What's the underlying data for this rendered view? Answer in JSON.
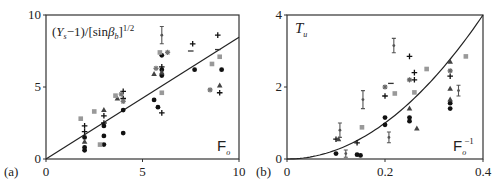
{
  "chart_data": [
    {
      "type": "scatter",
      "panel_label": "(a)",
      "title": "",
      "ylabel": "(Ys−1)/[sinβb]^1/2",
      "ylabel_parts": {
        "open": "(",
        "var": "Y",
        "sub": "s",
        "mid": "−1)/[sin",
        "greek": "β",
        "greek_sub": "b",
        "close": "]",
        "sup": "1/2"
      },
      "xlabel": "Fo",
      "xlabel_parts": {
        "main": "F",
        "sub": "o",
        "sup": ""
      },
      "xlim": [
        0,
        10
      ],
      "ylim": [
        0,
        10
      ],
      "xticks": [
        "0",
        "5",
        "10"
      ],
      "yticks": [
        "0",
        "5",
        "10"
      ],
      "fit_line": {
        "type": "linear",
        "x": [
          0,
          10
        ],
        "y": [
          0,
          8.45
        ]
      },
      "series": [
        {
          "name": "filled-circle",
          "marker": "circle",
          "color": "#111111",
          "points": [
            [
              2,
              0.6
            ],
            [
              2,
              0.8
            ],
            [
              2,
              1.5
            ],
            [
              3,
              1.0
            ],
            [
              3,
              1.6
            ],
            [
              3,
              2.3
            ],
            [
              4,
              1.8
            ],
            [
              4,
              3.4
            ],
            [
              5.6,
              4.1
            ],
            [
              5.8,
              3.6
            ],
            [
              6,
              5.8
            ],
            [
              6,
              6.2
            ],
            [
              6,
              7.2
            ],
            [
              7.7,
              6.2
            ],
            [
              9.1,
              6.2
            ]
          ]
        },
        {
          "name": "plus",
          "marker": "plus",
          "color": "#111111",
          "points": [
            [
              2,
              2.3
            ],
            [
              2,
              1.9
            ],
            [
              3,
              3.0
            ],
            [
              3,
              2.5
            ],
            [
              4,
              4.7
            ],
            [
              4,
              4.2
            ],
            [
              6,
              3.2
            ],
            [
              6,
              6.4
            ],
            [
              7.6,
              8.0
            ],
            [
              8.9,
              8.6
            ],
            [
              9,
              4.6
            ]
          ]
        },
        {
          "name": "triangle",
          "marker": "triangle",
          "color": "#444444",
          "points": [
            [
              2,
              1.2
            ],
            [
              3,
              3.4
            ],
            [
              3.7,
              4.2
            ],
            [
              5.6,
              5.9
            ],
            [
              6,
              6.0
            ],
            [
              9,
              5.1
            ]
          ]
        },
        {
          "name": "grey-square",
          "marker": "square",
          "color": "#999999",
          "points": [
            [
              1.8,
              2.8
            ],
            [
              2.5,
              3.3
            ],
            [
              2.8,
              1.0
            ],
            [
              3.6,
              4.4
            ],
            [
              5.9,
              7.4
            ],
            [
              6,
              4.6
            ],
            [
              8.6,
              6.6
            ],
            [
              9,
              7.1
            ]
          ]
        },
        {
          "name": "grey-star",
          "marker": "star",
          "color": "#777777",
          "points": [
            [
              3.9,
              4.5
            ],
            [
              4,
              4.0
            ],
            [
              5.7,
              6.3
            ],
            [
              6.3,
              7.4
            ],
            [
              8.5,
              4.8
            ]
          ]
        },
        {
          "name": "dash",
          "marker": "dash",
          "color": "#333333",
          "points": [
            [
              7.5,
              7.5
            ],
            [
              8.9,
              7.6
            ]
          ]
        },
        {
          "name": "errorbar",
          "marker": "errorbar",
          "color": "#555555",
          "points": [
            [
              6,
              8.6
            ]
          ],
          "err": [
            0.6
          ]
        }
      ]
    },
    {
      "type": "scatter",
      "panel_label": "(b)",
      "title": "",
      "ylabel": "Tu",
      "ylabel_parts": {
        "var": "T",
        "sub": "u"
      },
      "xlabel": "Fo^−1",
      "xlabel_parts": {
        "main": "F",
        "sub": "o",
        "sup": "−1"
      },
      "xlim": [
        0,
        0.4
      ],
      "ylim": [
        0,
        4
      ],
      "xticks": [
        "0",
        "0.2",
        "0.4"
      ],
      "yticks": [
        "0",
        "2",
        "4"
      ],
      "fit_line": {
        "type": "quadratic",
        "equation": "T = 25·F²",
        "coef": 25
      },
      "series": [
        {
          "name": "filled-circle",
          "marker": "circle",
          "color": "#111111",
          "points": [
            [
              0.1,
              0.15
            ],
            [
              0.143,
              0.12
            ],
            [
              0.15,
              0.1
            ],
            [
              0.2,
              0.95
            ],
            [
              0.2,
              1.15
            ],
            [
              0.25,
              1.05
            ],
            [
              0.25,
              1.15
            ],
            [
              0.333,
              1.4
            ],
            [
              0.333,
              1.55
            ]
          ]
        },
        {
          "name": "plus",
          "marker": "plus",
          "color": "#111111",
          "points": [
            [
              0.1,
              0.55
            ],
            [
              0.143,
              0.45
            ],
            [
              0.2,
              1.75
            ],
            [
              0.25,
              2.85
            ],
            [
              0.26,
              2.4
            ],
            [
              0.26,
              2.2
            ],
            [
              0.333,
              2.3
            ]
          ]
        },
        {
          "name": "triangle",
          "marker": "triangle",
          "color": "#444444",
          "points": [
            [
              0.105,
              0.55
            ],
            [
              0.25,
              1.4
            ],
            [
              0.265,
              0.85
            ],
            [
              0.333,
              1.95
            ],
            [
              0.333,
              1.65
            ],
            [
              0.333,
              2.7
            ]
          ]
        },
        {
          "name": "grey-square",
          "marker": "square",
          "color": "#999999",
          "points": [
            [
              0.153,
              0.88
            ],
            [
              0.22,
              1.82
            ],
            [
              0.26,
              1.85
            ],
            [
              0.285,
              2.5
            ],
            [
              0.365,
              2.85
            ]
          ]
        },
        {
          "name": "grey-star",
          "marker": "star",
          "color": "#666666",
          "points": [
            [
              0.2,
              2.0
            ],
            [
              0.25,
              2.2
            ],
            [
              0.333,
              2.45
            ]
          ]
        },
        {
          "name": "dash",
          "marker": "dash",
          "color": "#333333",
          "points": [
            [
              0.212,
              2.1
            ]
          ]
        },
        {
          "name": "errorbar",
          "marker": "errorbar",
          "color": "#555555",
          "points": [
            [
              0.108,
              0.8
            ],
            [
              0.12,
              0.15
            ],
            [
              0.155,
              1.65
            ],
            [
              0.208,
              0.6
            ],
            [
              0.218,
              3.15
            ],
            [
              0.35,
              1.9
            ]
          ],
          "err": [
            0.2,
            0.1,
            0.25,
            0.15,
            0.2,
            0.15
          ]
        }
      ]
    }
  ]
}
